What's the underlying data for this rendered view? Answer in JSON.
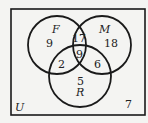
{
  "diagram": {
    "type": "venn-3",
    "universe_label": "U",
    "sets": [
      {
        "label": "F",
        "cx": 57,
        "cy": 45,
        "r": 29
      },
      {
        "label": "M",
        "cx": 102,
        "cy": 45,
        "r": 29
      },
      {
        "label": "R",
        "cx": 80,
        "cy": 76,
        "r": 31
      }
    ],
    "regions": {
      "F_only": "9",
      "M_only": "18",
      "R_only": "5",
      "F_M_only": "17",
      "F_R_only": "2",
      "M_R_only": "6",
      "F_M_R": "9",
      "outside": "7"
    },
    "colors": {
      "stroke": "#1a1a1a",
      "background": "#f4f4f2",
      "text": "#222222"
    }
  }
}
